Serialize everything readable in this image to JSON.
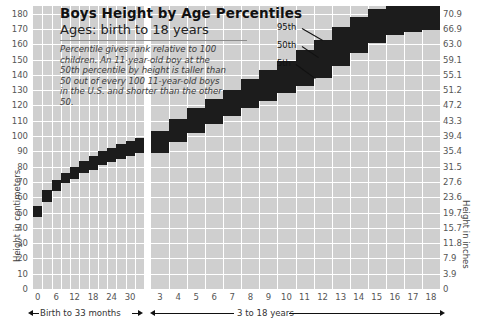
{
  "header": {
    "title": "Boys Height by Age Percentiles",
    "subtitle": "Ages: birth to 18 years",
    "blurb": "Percentile gives rank relative to 100 children. An 11-year-old boy at the 50th percentile by height is taller than 50 out of every 100 11-year-old boys in the U.S. and shorter than the other 50."
  },
  "axes": {
    "left_title": "Height in centimeters",
    "right_title": "Height in inches",
    "left_ticks": [
      180,
      170,
      160,
      150,
      140,
      130,
      120,
      110,
      100,
      90,
      80,
      70,
      60,
      50,
      40,
      30,
      20,
      10,
      0
    ],
    "right_ticks": [
      "70.9",
      "66.9",
      "63.0",
      "59.1",
      "55.1",
      "51.2",
      "47.2",
      "43.3",
      "39.4",
      "35.4",
      "31.5",
      "27.6",
      "23.6",
      "19.7",
      "15.7",
      "11.8",
      "7.9",
      "3.9",
      "0"
    ]
  },
  "panels": {
    "left": {
      "range_label": "Birth to 33 months",
      "x_ticks": [
        "0",
        "6",
        "12",
        "18",
        "24",
        "30"
      ]
    },
    "right": {
      "range_label": "3 to 18 years",
      "x_ticks": [
        "3",
        "4",
        "5",
        "6",
        "7",
        "8",
        "9",
        "10",
        "11",
        "12",
        "13",
        "14",
        "15",
        "16",
        "17",
        "18"
      ]
    }
  },
  "callouts": [
    {
      "label": "95th"
    },
    {
      "label": "50th"
    },
    {
      "label": "5th"
    }
  ],
  "colors": {
    "band": "#1c1c1c",
    "panel_fill": "#cfcfcf",
    "grid": "#ffffff",
    "text": "#3a3a3a"
  },
  "chart_data": {
    "type": "area",
    "title": "Boys Height by Age Percentiles",
    "subtitle": "Ages: birth to 18 years",
    "xlabel": "Age",
    "ylabel": "Height in centimeters",
    "ylabel_secondary": "Height in inches",
    "ylim": [
      0,
      185
    ],
    "grid": true,
    "legend": [
      "95th",
      "50th",
      "5th"
    ],
    "panels": [
      {
        "name": "Birth to 33 months",
        "x_unit": "months",
        "x": [
          0,
          3,
          6,
          9,
          12,
          15,
          18,
          21,
          24,
          27,
          30,
          33
        ],
        "series": [
          {
            "name": "5th",
            "values": [
              47,
              57,
              64,
              69,
              72,
              76,
              78,
              81,
              83,
              85,
              87,
              89
            ]
          },
          {
            "name": "50th",
            "values": [
              50,
              61,
              67,
              72,
              76,
              79,
              82,
              85,
              87,
              89,
              91,
              94
            ]
          },
          {
            "name": "95th",
            "values": [
              54,
              65,
              71,
              76,
              80,
              84,
              87,
              90,
              92,
              95,
              97,
              99
            ]
          }
        ]
      },
      {
        "name": "3 to 18 years",
        "x_unit": "years",
        "x": [
          3,
          4,
          5,
          6,
          7,
          8,
          9,
          10,
          11,
          12,
          13,
          14,
          15,
          16,
          17,
          18
        ],
        "series": [
          {
            "name": "5th",
            "values": [
              89,
              96,
              102,
              108,
              113,
              118,
              123,
              128,
              133,
              138,
              146,
              154,
              161,
              166,
              168,
              169
            ]
          },
          {
            "name": "50th",
            "values": [
              96,
              103,
              110,
              116,
              122,
              128,
              133,
              139,
              144,
              150,
              158,
              165,
              171,
              175,
              176,
              177
            ]
          },
          {
            "name": "95th",
            "values": [
              103,
              111,
              118,
              124,
              130,
              137,
              143,
              149,
              156,
              163,
              171,
              178,
              183,
              186,
              187,
              188
            ]
          }
        ]
      }
    ]
  }
}
